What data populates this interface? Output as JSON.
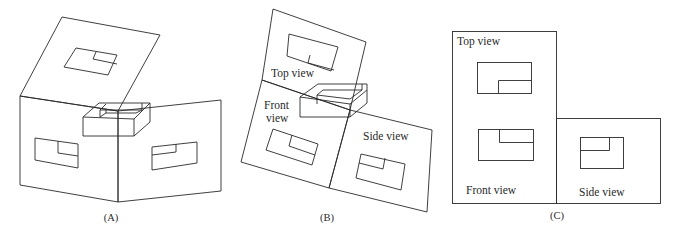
{
  "figure": {
    "panels": [
      {
        "id": "A",
        "caption": "(A)",
        "description": "Glass box with object inside, three projection planes folded out in 3D"
      },
      {
        "id": "B",
        "caption": "(B)",
        "labels": {
          "top": "Top view",
          "front_line1": "Front",
          "front_line2": "view",
          "side": "Side view"
        }
      },
      {
        "id": "C",
        "caption": "(C)",
        "labels": {
          "top": "Top view",
          "front": "Front view",
          "side": "Side view"
        }
      }
    ]
  }
}
